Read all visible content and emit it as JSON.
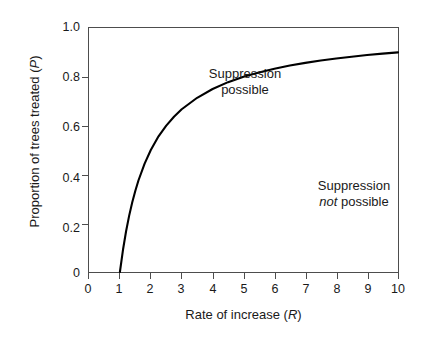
{
  "chart_data": {
    "type": "line",
    "title": "",
    "xlabel": "Rate of increase (R)",
    "xlabel_plain": "Rate of increase",
    "xlabel_symbol": "R",
    "ylabel": "Proportion of trees treated (P)",
    "ylabel_plain": "Proportion of trees treated",
    "ylabel_symbol": "P",
    "xlim": [
      0,
      10
    ],
    "ylim": [
      0,
      1.0
    ],
    "xticks": [
      "0",
      "1",
      "2",
      "3",
      "4",
      "5",
      "6",
      "7",
      "8",
      "9",
      "10"
    ],
    "xtick_values": [
      0,
      1,
      2,
      3,
      4,
      5,
      6,
      7,
      8,
      9,
      10
    ],
    "yticks": [
      "0",
      "0.2",
      "0.4",
      "0.6",
      "0.8",
      "1.0"
    ],
    "ytick_values": [
      0,
      0.2,
      0.4,
      0.6,
      0.8,
      1.0
    ],
    "grid": false,
    "legend": false,
    "line_color": "#000000",
    "axis_color": "#4d4d4d",
    "series": [
      {
        "name": "Suppression threshold P = 1 - 1/R",
        "x": [
          1.0,
          1.1,
          1.2,
          1.3,
          1.4,
          1.5,
          1.6,
          1.8,
          2.0,
          2.25,
          2.5,
          2.75,
          3.0,
          3.5,
          4.0,
          4.5,
          5.0,
          5.5,
          6.0,
          6.5,
          7.0,
          7.5,
          8.0,
          8.5,
          9.0,
          9.5,
          10.0
        ],
        "values": [
          0.0,
          0.091,
          0.167,
          0.231,
          0.286,
          0.333,
          0.375,
          0.444,
          0.5,
          0.556,
          0.6,
          0.636,
          0.667,
          0.714,
          0.75,
          0.778,
          0.8,
          0.818,
          0.833,
          0.846,
          0.857,
          0.867,
          0.875,
          0.882,
          0.889,
          0.895,
          0.9
        ]
      }
    ],
    "annotations": [
      {
        "id": "suppression-possible",
        "line1": "Suppression",
        "line2": "possible",
        "line2_italic": "",
        "x": 1.5,
        "y": 0.93
      },
      {
        "id": "suppression-not-possible",
        "line1": "Suppression",
        "line2_italic": "not",
        "line2": " possible",
        "x": 6.0,
        "y": 0.53
      }
    ]
  }
}
